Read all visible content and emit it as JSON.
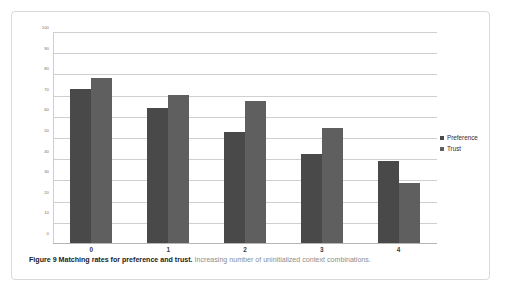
{
  "figure": {
    "caption_bold": "Figure 9 Matching rates for preference and trust.",
    "caption_rest": " Increasing number of uninitialized context combinations."
  },
  "legend": {
    "items": [
      {
        "label": "Preference",
        "color": "#494949",
        "marker": "square-marker"
      },
      {
        "label": "Trust",
        "color": "#5f5f5f",
        "marker": "square-marker"
      }
    ]
  },
  "chart_data": {
    "type": "bar",
    "title": "",
    "xlabel": "",
    "ylabel": "",
    "ylim": [
      0,
      100
    ],
    "yticks": [
      100,
      90,
      80,
      70,
      60,
      50,
      40,
      30,
      20,
      10,
      0
    ],
    "ytick_labels": [
      "100",
      "90",
      "80",
      "70",
      "60",
      "50",
      "40",
      "30",
      "20",
      "10",
      "0"
    ],
    "categories": [
      "0",
      "1",
      "2",
      "3",
      "4"
    ],
    "grid": true,
    "legend_position": "right",
    "series": [
      {
        "name": "Preference",
        "color": "#494949",
        "values": [
          73,
          64,
          53,
          42.5,
          39
        ]
      },
      {
        "name": "Trust",
        "color": "#5f5f5f",
        "values": [
          78.5,
          70.5,
          67.5,
          54.5,
          29
        ]
      }
    ]
  }
}
